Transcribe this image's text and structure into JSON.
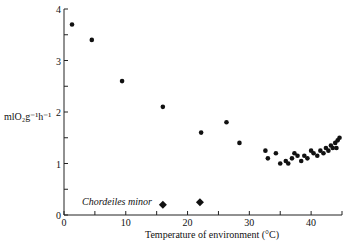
{
  "chart_data": {
    "type": "scatter",
    "title": "",
    "xlabel": "Temperature of environment (°C)",
    "ylabel": "mlO₂g⁻¹h⁻¹",
    "xlim": [
      0,
      45
    ],
    "ylim": [
      0,
      4
    ],
    "x_ticks": [
      0,
      10,
      20,
      30,
      40
    ],
    "y_ticks": [
      0,
      1,
      2,
      3,
      4
    ],
    "grid": false,
    "annotations": [
      "Chordeiles minor"
    ],
    "series": [
      {
        "name": "resting metabolic rate",
        "marker": "circle",
        "points": [
          [
            1.3,
            3.7
          ],
          [
            4.5,
            3.4
          ],
          [
            9.4,
            2.6
          ],
          [
            16.0,
            2.1
          ],
          [
            22.2,
            1.6
          ],
          [
            26.3,
            1.8
          ],
          [
            28.4,
            1.4
          ],
          [
            32.6,
            1.25
          ],
          [
            33.0,
            1.1
          ],
          [
            34.3,
            1.2
          ],
          [
            35.0,
            1.0
          ],
          [
            35.9,
            1.05
          ],
          [
            36.3,
            1.0
          ],
          [
            36.9,
            1.1
          ],
          [
            37.3,
            1.2
          ],
          [
            37.8,
            1.15
          ],
          [
            38.4,
            1.05
          ],
          [
            38.9,
            1.15
          ],
          [
            39.4,
            1.1
          ],
          [
            40.0,
            1.25
          ],
          [
            40.4,
            1.2
          ],
          [
            41.0,
            1.15
          ],
          [
            41.5,
            1.25
          ],
          [
            42.0,
            1.2
          ],
          [
            42.4,
            1.3
          ],
          [
            42.8,
            1.25
          ],
          [
            43.2,
            1.35
          ],
          [
            43.5,
            1.3
          ],
          [
            43.9,
            1.4
          ],
          [
            44.3,
            1.45
          ],
          [
            44.6,
            1.5
          ],
          [
            44.1,
            1.3
          ]
        ]
      },
      {
        "name": "torpor",
        "marker": "diamond",
        "points": [
          [
            16.0,
            0.2
          ],
          [
            22.0,
            0.25
          ]
        ]
      }
    ]
  },
  "labels": {
    "ylabel": "mlO₂g⁻¹h⁻¹",
    "xlabel": "Temperature of environment (°C)",
    "species": "Chordeiles minor"
  }
}
